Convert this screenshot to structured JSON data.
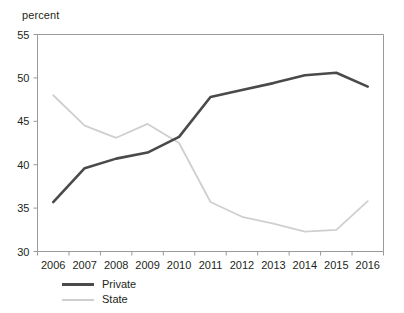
{
  "chart_data": {
    "type": "line",
    "title": "",
    "subtitle": "",
    "xlabel": "",
    "ylabel": "percent",
    "ylim": [
      30,
      55
    ],
    "yticks": [
      30,
      35,
      40,
      45,
      50,
      55
    ],
    "ytick_labels": [
      "30",
      "35",
      "40",
      "45",
      "50",
      "55"
    ],
    "grid": false,
    "legend_position": "below-left",
    "categories": [
      2006,
      2007,
      2008,
      2009,
      2010,
      2011,
      2012,
      2013,
      2014,
      2015,
      2016
    ],
    "xtick_labels": [
      "2006",
      "2007",
      "2008",
      "2009",
      "2010",
      "2011",
      "2012",
      "2013",
      "2014",
      "2015",
      "2016"
    ],
    "series": [
      {
        "name": "Private",
        "color": "#4a4a4a",
        "line_width": 2.6,
        "values": [
          35.7,
          39.6,
          40.7,
          41.4,
          43.2,
          47.8,
          48.6,
          49.4,
          50.3,
          50.6,
          49.0
        ]
      },
      {
        "name": "State",
        "color": "#cfcfcf",
        "line_width": 1.8,
        "values": [
          48.0,
          44.5,
          43.1,
          44.7,
          42.5,
          35.7,
          34.0,
          33.2,
          32.3,
          32.5,
          35.8
        ]
      }
    ]
  },
  "axis": {
    "unit_label": "percent"
  },
  "legend": {
    "items": [
      {
        "label": "Private"
      },
      {
        "label": "State"
      }
    ]
  },
  "colors": {
    "private": "#4a4a4a",
    "state": "#cfcfcf",
    "axis": "#9a9a9a",
    "text": "#231f20",
    "background": "#ffffff"
  }
}
